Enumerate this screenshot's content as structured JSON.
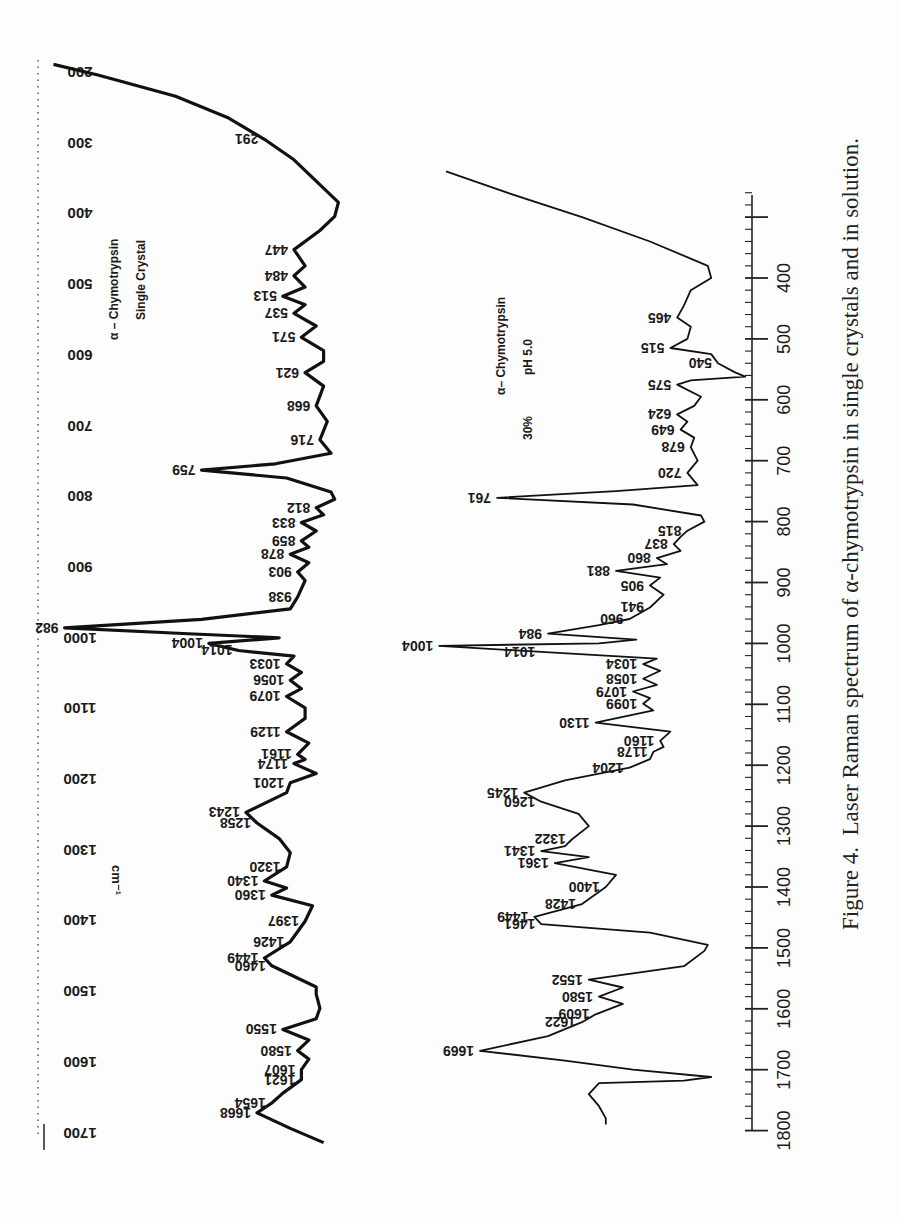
{
  "caption": {
    "prefix": "Figure 4.",
    "text": "Laser Raman spectrum of α-chymotrypsin in single crystals and in solution."
  },
  "chart_data": [
    {
      "type": "line",
      "title": "α – Chymotrypsin  Single Crystal",
      "label_line1": "α – Chymotrypsin",
      "label_line2": "Single Crystal",
      "xlabel": "cm⁻¹",
      "ylabel": "Raman intensity",
      "axis_range": [
        200,
        1700
      ],
      "axis_ticks": [
        200,
        300,
        400,
        500,
        600,
        700,
        800,
        900,
        1000,
        1100,
        1200,
        1300,
        1400,
        1500,
        1600,
        1700
      ],
      "orientation": "rotated 180° (wavenumber axis vertical on left, labels upside-down)",
      "peaks": [
        291,
        447,
        484,
        513,
        537,
        571,
        621,
        668,
        716,
        759,
        812,
        833,
        859,
        878,
        903,
        938,
        982,
        1004,
        1014,
        1033,
        1056,
        1079,
        1129,
        1161,
        1174,
        1201,
        1243,
        1258,
        1320,
        1340,
        1360,
        1397,
        1426,
        1449,
        1460,
        1550,
        1580,
        1607,
        1621,
        1654,
        1668
      ],
      "curve": [
        [
          185,
          0.95
        ],
        [
          200,
          0.83
        ],
        [
          230,
          0.62
        ],
        [
          260,
          0.48
        ],
        [
          291,
          0.38
        ],
        [
          320,
          0.3
        ],
        [
          350,
          0.24
        ],
        [
          380,
          0.18
        ],
        [
          400,
          0.19
        ],
        [
          420,
          0.23
        ],
        [
          447,
          0.3
        ],
        [
          470,
          0.27
        ],
        [
          484,
          0.3
        ],
        [
          500,
          0.27
        ],
        [
          513,
          0.33
        ],
        [
          525,
          0.27
        ],
        [
          537,
          0.3
        ],
        [
          555,
          0.24
        ],
        [
          571,
          0.28
        ],
        [
          590,
          0.22
        ],
        [
          605,
          0.22
        ],
        [
          621,
          0.27
        ],
        [
          640,
          0.22
        ],
        [
          668,
          0.24
        ],
        [
          690,
          0.21
        ],
        [
          716,
          0.23
        ],
        [
          735,
          0.2
        ],
        [
          750,
          0.35
        ],
        [
          759,
          0.55
        ],
        [
          770,
          0.32
        ],
        [
          790,
          0.2
        ],
        [
          800,
          0.19
        ],
        [
          812,
          0.24
        ],
        [
          822,
          0.22
        ],
        [
          833,
          0.28
        ],
        [
          845,
          0.24
        ],
        [
          859,
          0.28
        ],
        [
          868,
          0.26
        ],
        [
          878,
          0.31
        ],
        [
          890,
          0.26
        ],
        [
          903,
          0.29
        ],
        [
          915,
          0.27
        ],
        [
          938,
          0.29
        ],
        [
          955,
          0.31
        ],
        [
          970,
          0.55
        ],
        [
          982,
          0.92
        ],
        [
          990,
          0.6
        ],
        [
          996,
          0.34
        ],
        [
          1004,
          0.53
        ],
        [
          1014,
          0.45
        ],
        [
          1022,
          0.3
        ],
        [
          1033,
          0.32
        ],
        [
          1045,
          0.28
        ],
        [
          1056,
          0.31
        ],
        [
          1068,
          0.28
        ],
        [
          1079,
          0.32
        ],
        [
          1095,
          0.27
        ],
        [
          1110,
          0.27
        ],
        [
          1129,
          0.32
        ],
        [
          1145,
          0.26
        ],
        [
          1161,
          0.29
        ],
        [
          1168,
          0.27
        ],
        [
          1174,
          0.3
        ],
        [
          1188,
          0.24
        ],
        [
          1201,
          0.31
        ],
        [
          1215,
          0.32
        ],
        [
          1243,
          0.43
        ],
        [
          1258,
          0.4
        ],
        [
          1280,
          0.34
        ],
        [
          1300,
          0.31
        ],
        [
          1320,
          0.32
        ],
        [
          1340,
          0.38
        ],
        [
          1350,
          0.32
        ],
        [
          1360,
          0.36
        ],
        [
          1375,
          0.25
        ],
        [
          1397,
          0.27
        ],
        [
          1426,
          0.31
        ],
        [
          1449,
          0.38
        ],
        [
          1460,
          0.36
        ],
        [
          1490,
          0.24
        ],
        [
          1500,
          0.24
        ],
        [
          1520,
          0.23
        ],
        [
          1535,
          0.24
        ],
        [
          1550,
          0.33
        ],
        [
          1565,
          0.26
        ],
        [
          1580,
          0.29
        ],
        [
          1592,
          0.26
        ],
        [
          1607,
          0.28
        ],
        [
          1621,
          0.28
        ],
        [
          1640,
          0.33
        ],
        [
          1654,
          0.36
        ],
        [
          1668,
          0.4
        ],
        [
          1690,
          0.31
        ],
        [
          1710,
          0.22
        ]
      ]
    },
    {
      "type": "line",
      "title": "α– Chymotrypsin  30%  pH 5.0",
      "label_line1": "α– Chymotrypsin",
      "label_line2a": "30%",
      "label_line2b": "pH 5.0",
      "xlabel": "cm⁻¹",
      "ylabel": "Raman intensity",
      "axis_range": [
        400,
        1800
      ],
      "axis_ticks": [
        400,
        500,
        600,
        700,
        800,
        900,
        1000,
        1100,
        1200,
        1300,
        1400,
        1500,
        1600,
        1700,
        1800
      ],
      "axis_tick_labels": [
        "400",
        "500",
        "600",
        "700",
        "800",
        "900",
        "1000",
        "1100",
        "1200",
        "1300",
        "1400",
        "1500",
        "1600",
        "1700",
        "1800"
      ],
      "peaks": [
        465,
        515,
        540,
        575,
        624,
        649,
        678,
        720,
        761,
        815,
        837,
        860,
        881,
        905,
        941,
        960,
        984,
        1004,
        1014,
        1034,
        1058,
        1079,
        1099,
        1130,
        1160,
        1178,
        1204,
        1245,
        1260,
        1322,
        1341,
        1361,
        1400,
        1428,
        1449,
        1461,
        1552,
        1580,
        1609,
        1622,
        1669
      ],
      "curve": [
        [
          225,
          0.9
        ],
        [
          260,
          0.72
        ],
        [
          300,
          0.5
        ],
        [
          340,
          0.3
        ],
        [
          380,
          0.13
        ],
        [
          400,
          0.12
        ],
        [
          420,
          0.18
        ],
        [
          445,
          0.2
        ],
        [
          465,
          0.22
        ],
        [
          480,
          0.18
        ],
        [
          500,
          0.19
        ],
        [
          515,
          0.24
        ],
        [
          525,
          0.12
        ],
        [
          540,
          0.1
        ],
        [
          555,
          0.05
        ],
        [
          562,
          0.02
        ],
        [
          568,
          0.18
        ],
        [
          575,
          0.22
        ],
        [
          595,
          0.15
        ],
        [
          610,
          0.17
        ],
        [
          624,
          0.22
        ],
        [
          636,
          0.19
        ],
        [
          649,
          0.21
        ],
        [
          662,
          0.17
        ],
        [
          678,
          0.18
        ],
        [
          700,
          0.16
        ],
        [
          720,
          0.19
        ],
        [
          740,
          0.16
        ],
        [
          750,
          0.4
        ],
        [
          761,
          0.75
        ],
        [
          772,
          0.35
        ],
        [
          790,
          0.15
        ],
        [
          800,
          0.14
        ],
        [
          815,
          0.19
        ],
        [
          825,
          0.21
        ],
        [
          837,
          0.23
        ],
        [
          848,
          0.21
        ],
        [
          860,
          0.28
        ],
        [
          870,
          0.25
        ],
        [
          881,
          0.4
        ],
        [
          892,
          0.27
        ],
        [
          905,
          0.3
        ],
        [
          920,
          0.26
        ],
        [
          941,
          0.3
        ],
        [
          960,
          0.36
        ],
        [
          970,
          0.45
        ],
        [
          984,
          0.6
        ],
        [
          994,
          0.34
        ],
        [
          1000,
          0.45
        ],
        [
          1004,
          0.92
        ],
        [
          1014,
          0.62
        ],
        [
          1025,
          0.28
        ],
        [
          1034,
          0.32
        ],
        [
          1045,
          0.27
        ],
        [
          1058,
          0.32
        ],
        [
          1068,
          0.28
        ],
        [
          1079,
          0.35
        ],
        [
          1090,
          0.3
        ],
        [
          1099,
          0.32
        ],
        [
          1110,
          0.29
        ],
        [
          1130,
          0.46
        ],
        [
          1145,
          0.24
        ],
        [
          1160,
          0.27
        ],
        [
          1170,
          0.26
        ],
        [
          1178,
          0.29
        ],
        [
          1190,
          0.3
        ],
        [
          1204,
          0.36
        ],
        [
          1225,
          0.55
        ],
        [
          1245,
          0.67
        ],
        [
          1260,
          0.62
        ],
        [
          1280,
          0.51
        ],
        [
          1300,
          0.48
        ],
        [
          1322,
          0.53
        ],
        [
          1333,
          0.55
        ],
        [
          1341,
          0.62
        ],
        [
          1351,
          0.48
        ],
        [
          1361,
          0.58
        ],
        [
          1380,
          0.4
        ],
        [
          1400,
          0.43
        ],
        [
          1428,
          0.5
        ],
        [
          1449,
          0.64
        ],
        [
          1461,
          0.62
        ],
        [
          1475,
          0.3
        ],
        [
          1495,
          0.13
        ],
        [
          1505,
          0.14
        ],
        [
          1530,
          0.2
        ],
        [
          1552,
          0.48
        ],
        [
          1565,
          0.38
        ],
        [
          1580,
          0.45
        ],
        [
          1592,
          0.38
        ],
        [
          1609,
          0.46
        ],
        [
          1622,
          0.5
        ],
        [
          1645,
          0.6
        ],
        [
          1669,
          0.8
        ],
        [
          1685,
          0.55
        ],
        [
          1700,
          0.35
        ],
        [
          1712,
          0.12
        ],
        [
          1718,
          0.2
        ],
        [
          1722,
          0.45
        ],
        [
          1740,
          0.48
        ],
        [
          1760,
          0.45
        ],
        [
          1780,
          0.43
        ],
        [
          1790,
          0.43
        ]
      ]
    }
  ],
  "axis_unit_label": "cm⁻¹"
}
